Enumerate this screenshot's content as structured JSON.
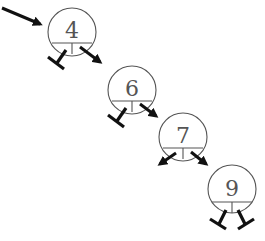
{
  "diagram": {
    "type": "binary-search-tree",
    "nodes": [
      {
        "id": "n4",
        "label": "4",
        "cx": 72,
        "cy": 32,
        "r": 24,
        "left": "null",
        "right": "n6"
      },
      {
        "id": "n6",
        "label": "6",
        "cx": 132,
        "cy": 90,
        "r": 24,
        "left": "null",
        "right": "n7"
      },
      {
        "id": "n7",
        "label": "7",
        "cx": 183,
        "cy": 137,
        "r": 24,
        "left": "arrow",
        "right": "n9"
      },
      {
        "id": "n9",
        "label": "9",
        "cx": 232,
        "cy": 189,
        "r": 24,
        "left": "null",
        "right": "null"
      }
    ],
    "root_pointer": {
      "from": [
        2,
        8
      ],
      "to": [
        44,
        26
      ]
    },
    "colors": {
      "node_stroke": "#555555",
      "pointer": "#111111",
      "background": "#ffffff"
    }
  }
}
